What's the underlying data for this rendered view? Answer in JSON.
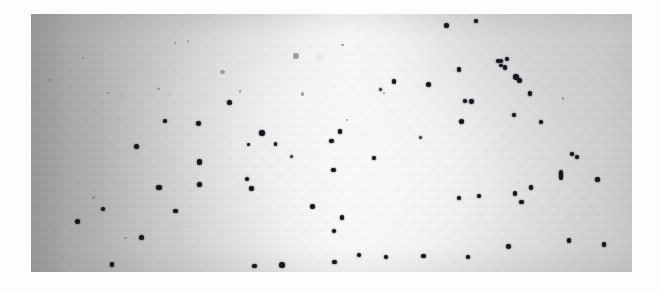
{
  "image": {
    "title": "Scanned photographic plate with dark point sources",
    "kind": "grayscale-photograph",
    "canvas": {
      "width": 659,
      "height": 292,
      "background": "#fdfdfd"
    },
    "plate": {
      "x": 31,
      "y": 14,
      "width": 601,
      "height": 258,
      "base_tone": "#cfcfcf",
      "darkest_tone": "#a3a3a3",
      "brightest_tone": "#fbfbfb",
      "dot_color": "#15161a",
      "gradient_description": "Darkest along the left edge, brightening across the frame to a near-white lobe just right of centre, settling to mid-grey toward the right edge.",
      "texture": "halftone scan grain with faint mottled emulsion blotches"
    },
    "dot_count": 78,
    "dots": [
      {
        "x": 0.086,
        "y": 0.17,
        "r": 1.1,
        "cls": "faint"
      },
      {
        "x": 0.031,
        "y": 0.255,
        "r": 1.2,
        "cls": "faint"
      },
      {
        "x": 0.128,
        "y": 0.308,
        "r": 1.0,
        "cls": "faint"
      },
      {
        "x": 0.212,
        "y": 0.29,
        "r": 1.3,
        "cls": "faint"
      },
      {
        "x": 0.24,
        "y": 0.112,
        "r": 1.2,
        "cls": "faint"
      },
      {
        "x": 0.262,
        "y": 0.104,
        "r": 1.0,
        "cls": "faint"
      },
      {
        "x": 0.318,
        "y": 0.225,
        "r": 2.4,
        "cls": "faint"
      },
      {
        "x": 0.348,
        "y": 0.3,
        "r": 1.3,
        "cls": "faint"
      },
      {
        "x": 0.441,
        "y": 0.163,
        "r": 2.8,
        "cls": "faint"
      },
      {
        "x": 0.452,
        "y": 0.31,
        "r": 1.6,
        "cls": "faint"
      },
      {
        "x": 0.518,
        "y": 0.12,
        "r": 1.2,
        "cls": "faint"
      },
      {
        "x": 0.526,
        "y": 0.412,
        "r": 1.1,
        "cls": "faint"
      },
      {
        "x": 0.588,
        "y": 0.308,
        "r": 1.0,
        "cls": "faint"
      },
      {
        "x": 0.157,
        "y": 0.868,
        "r": 1.3,
        "cls": "faint"
      },
      {
        "x": 0.104,
        "y": 0.712,
        "r": 1.2,
        "cls": "faint"
      },
      {
        "x": 0.885,
        "y": 0.328,
        "r": 1.2,
        "cls": "faint"
      },
      {
        "x": 0.692,
        "y": 0.046,
        "r": 2.5,
        "cls": ""
      },
      {
        "x": 0.74,
        "y": 0.026,
        "r": 2.1,
        "cls": ""
      },
      {
        "x": 0.782,
        "y": 0.183,
        "r": 2.2,
        "cls": ""
      },
      {
        "x": 0.777,
        "y": 0.182,
        "r": 2.0,
        "cls": ""
      },
      {
        "x": 0.782,
        "y": 0.199,
        "r": 1.8,
        "cls": ""
      },
      {
        "x": 0.789,
        "y": 0.207,
        "r": 2.3,
        "cls": ""
      },
      {
        "x": 0.792,
        "y": 0.175,
        "r": 1.9,
        "cls": ""
      },
      {
        "x": 0.712,
        "y": 0.216,
        "r": 2.4,
        "cls": ""
      },
      {
        "x": 0.661,
        "y": 0.272,
        "r": 2.6,
        "cls": ""
      },
      {
        "x": 0.807,
        "y": 0.244,
        "r": 2.9,
        "cls": ""
      },
      {
        "x": 0.812,
        "y": 0.256,
        "r": 2.5,
        "cls": ""
      },
      {
        "x": 0.83,
        "y": 0.308,
        "r": 2.2,
        "cls": ""
      },
      {
        "x": 0.733,
        "y": 0.338,
        "r": 2.4,
        "cls": ""
      },
      {
        "x": 0.804,
        "y": 0.39,
        "r": 2.1,
        "cls": ""
      },
      {
        "x": 0.716,
        "y": 0.418,
        "r": 2.6,
        "cls": ""
      },
      {
        "x": 0.848,
        "y": 0.418,
        "r": 2.0,
        "cls": ""
      },
      {
        "x": 0.9,
        "y": 0.543,
        "r": 1.7,
        "cls": ""
      },
      {
        "x": 0.908,
        "y": 0.553,
        "r": 2.1,
        "cls": ""
      },
      {
        "x": 0.882,
        "y": 0.625,
        "r": 2.4,
        "cls": "streak"
      },
      {
        "x": 0.943,
        "y": 0.642,
        "r": 2.3,
        "cls": ""
      },
      {
        "x": 0.832,
        "y": 0.672,
        "r": 2.2,
        "cls": ""
      },
      {
        "x": 0.806,
        "y": 0.696,
        "r": 2.1,
        "cls": ""
      },
      {
        "x": 0.745,
        "y": 0.706,
        "r": 2.0,
        "cls": ""
      },
      {
        "x": 0.712,
        "y": 0.714,
        "r": 2.2,
        "cls": ""
      },
      {
        "x": 0.816,
        "y": 0.728,
        "r": 2.2,
        "cls": ""
      },
      {
        "x": 0.895,
        "y": 0.878,
        "r": 2.3,
        "cls": ""
      },
      {
        "x": 0.953,
        "y": 0.894,
        "r": 2.2,
        "cls": ""
      },
      {
        "x": 0.795,
        "y": 0.9,
        "r": 2.4,
        "cls": ""
      },
      {
        "x": 0.727,
        "y": 0.941,
        "r": 2.0,
        "cls": ""
      },
      {
        "x": 0.653,
        "y": 0.937,
        "r": 2.1,
        "cls": ""
      },
      {
        "x": 0.722,
        "y": 0.338,
        "r": 2.3,
        "cls": ""
      },
      {
        "x": 0.33,
        "y": 0.343,
        "r": 2.7,
        "cls": ""
      },
      {
        "x": 0.223,
        "y": 0.414,
        "r": 2.3,
        "cls": ""
      },
      {
        "x": 0.279,
        "y": 0.423,
        "r": 2.4,
        "cls": ""
      },
      {
        "x": 0.385,
        "y": 0.461,
        "r": 2.9,
        "cls": ""
      },
      {
        "x": 0.175,
        "y": 0.512,
        "r": 2.5,
        "cls": ""
      },
      {
        "x": 0.28,
        "y": 0.574,
        "r": 2.7,
        "cls": ""
      },
      {
        "x": 0.362,
        "y": 0.506,
        "r": 1.8,
        "cls": ""
      },
      {
        "x": 0.407,
        "y": 0.504,
        "r": 1.8,
        "cls": ""
      },
      {
        "x": 0.213,
        "y": 0.674,
        "r": 2.6,
        "cls": ""
      },
      {
        "x": 0.28,
        "y": 0.66,
        "r": 2.3,
        "cls": ""
      },
      {
        "x": 0.24,
        "y": 0.764,
        "r": 2.3,
        "cls": ""
      },
      {
        "x": 0.12,
        "y": 0.756,
        "r": 2.3,
        "cls": ""
      },
      {
        "x": 0.077,
        "y": 0.806,
        "r": 2.5,
        "cls": ""
      },
      {
        "x": 0.184,
        "y": 0.867,
        "r": 2.6,
        "cls": ""
      },
      {
        "x": 0.135,
        "y": 0.971,
        "r": 2.2,
        "cls": ""
      },
      {
        "x": 0.36,
        "y": 0.64,
        "r": 2.0,
        "cls": ""
      },
      {
        "x": 0.367,
        "y": 0.676,
        "r": 2.2,
        "cls": ""
      },
      {
        "x": 0.372,
        "y": 0.976,
        "r": 2.3,
        "cls": ""
      },
      {
        "x": 0.418,
        "y": 0.972,
        "r": 3.0,
        "cls": ""
      },
      {
        "x": 0.503,
        "y": 0.604,
        "r": 2.3,
        "cls": ""
      },
      {
        "x": 0.469,
        "y": 0.745,
        "r": 2.6,
        "cls": ""
      },
      {
        "x": 0.518,
        "y": 0.789,
        "r": 2.1,
        "cls": ""
      },
      {
        "x": 0.504,
        "y": 0.84,
        "r": 2.2,
        "cls": ""
      },
      {
        "x": 0.505,
        "y": 0.962,
        "r": 2.2,
        "cls": ""
      },
      {
        "x": 0.546,
        "y": 0.933,
        "r": 2.2,
        "cls": ""
      },
      {
        "x": 0.591,
        "y": 0.941,
        "r": 2.1,
        "cls": ""
      },
      {
        "x": 0.514,
        "y": 0.456,
        "r": 2.4,
        "cls": ""
      },
      {
        "x": 0.5,
        "y": 0.493,
        "r": 2.1,
        "cls": ""
      },
      {
        "x": 0.571,
        "y": 0.558,
        "r": 2.3,
        "cls": ""
      },
      {
        "x": 0.604,
        "y": 0.262,
        "r": 2.1,
        "cls": ""
      },
      {
        "x": 0.648,
        "y": 0.478,
        "r": 1.6,
        "cls": "soft"
      },
      {
        "x": 0.582,
        "y": 0.294,
        "r": 1.5,
        "cls": "soft"
      },
      {
        "x": 0.434,
        "y": 0.553,
        "r": 1.6,
        "cls": "soft"
      }
    ]
  }
}
